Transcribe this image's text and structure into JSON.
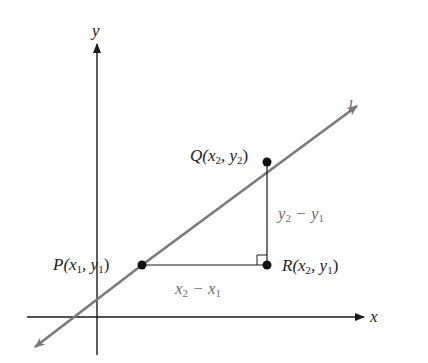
{
  "diagram": {
    "type": "coordinate-slope-diagram",
    "axes": {
      "x_label": "x",
      "y_label": "y"
    },
    "line": {
      "label": "l",
      "color": "#7a7a7a"
    },
    "points": {
      "P": {
        "name": "P",
        "coords": "(x1, y1)",
        "text_prefix": "P(x",
        "sub1": "1",
        "mid": ", y",
        "sub2": "1",
        "suffix": ")"
      },
      "Q": {
        "name": "Q",
        "coords": "(x2, y2)",
        "text_prefix": "Q(x",
        "sub1": "2",
        "mid": ", y",
        "sub2": "2",
        "suffix": ")"
      },
      "R": {
        "name": "R",
        "coords": "(x2, y1)",
        "text_prefix": "R(x",
        "sub1": "2",
        "mid": ", y",
        "sub2": "1",
        "suffix": ")"
      }
    },
    "run_label": {
      "a": "x",
      "a_sub": "2",
      "op": " − x",
      "b_sub": "1",
      "full": "x2 − x1"
    },
    "rise_label": {
      "a": "y",
      "a_sub": "2",
      "op": " − y",
      "b_sub": "1",
      "full": "y2 − y1"
    },
    "colors": {
      "axis": "#1a1a1a",
      "line": "#7a7a7a",
      "point": "#111111",
      "label_gray": "#6e6e6e"
    }
  }
}
